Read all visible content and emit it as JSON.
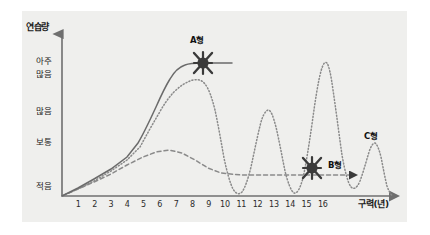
{
  "chart_data": {
    "type": "line",
    "title": "",
    "ylabel": "연습량",
    "xlabel": "구력(년)",
    "grid": false,
    "legend_position": "inline-annotations",
    "xlim": [
      0,
      17
    ],
    "ylim": [
      0,
      4.6
    ],
    "x_ticks": [
      "1",
      "2",
      "3",
      "4",
      "5",
      "6",
      "7",
      "8",
      "9",
      "10",
      "11",
      "12",
      "13",
      "14",
      "15",
      "16"
    ],
    "y_ticks": [
      {
        "label": "적음",
        "value": 0
      },
      {
        "label": "보통",
        "value": 1.3
      },
      {
        "label": "많음",
        "value": 2.2
      },
      {
        "label": "아주 많음",
        "line1": "아주",
        "line2": "많음",
        "value": 3.6
      }
    ],
    "series": [
      {
        "name": "A형",
        "style": "solid",
        "color": "#6b6b6b",
        "description": "꾸준히 증가 후 아주 많음 수준에서 유지",
        "points": [
          {
            "x": 0,
            "y": 0
          },
          {
            "x": 1,
            "y": 0.45
          },
          {
            "x": 2,
            "y": 1.0
          },
          {
            "x": 3,
            "y": 1.6
          },
          {
            "x": 4,
            "y": 2.3
          },
          {
            "x": 5,
            "y": 3.1
          },
          {
            "x": 5.6,
            "y": 3.7
          },
          {
            "x": 6.2,
            "y": 3.95
          },
          {
            "x": 7,
            "y": 4.0
          },
          {
            "x": 9,
            "y": 4.0
          },
          {
            "x": 11,
            "y": 4.0
          },
          {
            "x": 13,
            "y": 4.0
          }
        ],
        "marker": {
          "x": 13,
          "y": 4.0,
          "shape": "star-burst",
          "label": "A형"
        }
      },
      {
        "name": "B형",
        "style": "dotted",
        "color": "#8a8a8a",
        "description": "증가 후 급격한 기복 반복, 점차 하락",
        "points": [
          {
            "x": 0,
            "y": 0
          },
          {
            "x": 1,
            "y": 0.42
          },
          {
            "x": 2,
            "y": 0.95
          },
          {
            "x": 3,
            "y": 1.55
          },
          {
            "x": 4,
            "y": 2.25
          },
          {
            "x": 5,
            "y": 3.0
          },
          {
            "x": 5.7,
            "y": 3.6
          },
          {
            "x": 6.3,
            "y": 3.85
          },
          {
            "x": 7,
            "y": 3.6
          },
          {
            "x": 7.6,
            "y": 2.8
          },
          {
            "x": 8.1,
            "y": 1.6
          },
          {
            "x": 8.5,
            "y": 0.55
          },
          {
            "x": 8.9,
            "y": 0.2
          },
          {
            "x": 9.3,
            "y": 0.9
          },
          {
            "x": 9.7,
            "y": 2.1
          },
          {
            "x": 10.0,
            "y": 2.55
          },
          {
            "x": 10.4,
            "y": 1.9
          },
          {
            "x": 10.8,
            "y": 0.7
          },
          {
            "x": 11.1,
            "y": 0.15
          },
          {
            "x": 11.5,
            "y": 1.5
          },
          {
            "x": 11.9,
            "y": 3.3
          },
          {
            "x": 12.1,
            "y": 4.05
          },
          {
            "x": 12.4,
            "y": 3.2
          },
          {
            "x": 12.8,
            "y": 1.6
          },
          {
            "x": 13.1,
            "y": 0.45
          },
          {
            "x": 13.4,
            "y": 0.55
          },
          {
            "x": 13.7,
            "y": 1.5
          },
          {
            "x": 14.0,
            "y": 1.85
          },
          {
            "x": 14.3,
            "y": 1.35
          },
          {
            "x": 14.7,
            "y": 0.5
          },
          {
            "x": 15.0,
            "y": 0.3
          },
          {
            "x": 15.4,
            "y": 1.3
          },
          {
            "x": 15.8,
            "y": 2.9
          },
          {
            "x": 16.1,
            "y": 3.75
          },
          {
            "x": 16.4,
            "y": 3.1
          },
          {
            "x": 16.8,
            "y": 1.6
          },
          {
            "x": 17.1,
            "y": 0.6
          }
        ],
        "marker": {
          "x": 15.4,
          "y": 0.62,
          "shape": "star-burst",
          "label": "B형"
        }
      },
      {
        "name": "C형",
        "style": "dashed",
        "color": "#8a8a8a",
        "description": "초반 상승 후 보통 수준에서 평탄하게 유지",
        "points": [
          {
            "x": 0,
            "y": 0
          },
          {
            "x": 1,
            "y": 0.38
          },
          {
            "x": 2,
            "y": 0.85
          },
          {
            "x": 3,
            "y": 1.35
          },
          {
            "x": 4,
            "y": 1.9
          },
          {
            "x": 5,
            "y": 2.35
          },
          {
            "x": 5.8,
            "y": 2.6
          },
          {
            "x": 6.6,
            "y": 2.6
          },
          {
            "x": 7.4,
            "y": 2.3
          },
          {
            "x": 8.2,
            "y": 1.8
          },
          {
            "x": 9.0,
            "y": 1.45
          },
          {
            "x": 9.8,
            "y": 1.32
          },
          {
            "x": 11,
            "y": 1.3
          },
          {
            "x": 13,
            "y": 1.3
          },
          {
            "x": 15,
            "y": 1.3
          },
          {
            "x": 17,
            "y": 1.3
          }
        ],
        "end_arrow": true,
        "label": "C형"
      }
    ],
    "annotations": [
      {
        "name": "A형",
        "text": "A형"
      },
      {
        "name": "B형",
        "text": "B형"
      },
      {
        "name": "C형",
        "text": "C형"
      }
    ]
  },
  "axes": {
    "y_title": "연습량",
    "x_title": "구력(년)",
    "y_labels": {
      "very_many_line1": "아주",
      "very_many_line2": "많음",
      "many": "많음",
      "normal": "보통",
      "few": "적음"
    },
    "x_labels": [
      "1",
      "2",
      "3",
      "4",
      "5",
      "6",
      "7",
      "8",
      "9",
      "10",
      "11",
      "12",
      "13",
      "14",
      "15",
      "16"
    ]
  },
  "labels": {
    "type_a": "A형",
    "type_b": "B형",
    "type_c": "C형"
  },
  "colors": {
    "panel_background": "#efefed",
    "page_background": "#ffffff",
    "axis": "#6f6f6f",
    "series_a": "#6b6b6b",
    "series_b": "#8a8a8a",
    "series_c": "#8a8a8a",
    "marker": "#3a3a3a",
    "text": "#1a1a1a"
  }
}
